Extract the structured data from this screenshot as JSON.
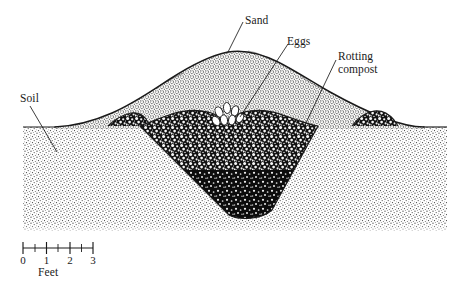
{
  "figure": {
    "labels": {
      "sand": "Sand",
      "eggs": "Eggs",
      "rotting_compost_line1": "Rotting",
      "rotting_compost_line2": "compost",
      "soil": "Soil"
    },
    "scale": {
      "unit_label": "Feet",
      "ticks": [
        "0",
        "1",
        "2",
        "3"
      ],
      "minor_ticks_between": 1
    },
    "colors": {
      "ink": "#1a1a1a",
      "paper": "#ffffff",
      "sand_fill": "#e8e5df",
      "soil_fill": "#f4f3f0",
      "compost_fill": "#1c1c1c",
      "egg_fill": "#ffffff"
    },
    "regions": [
      {
        "name": "soil",
        "texture": "fine-stipple",
        "label": "Soil"
      },
      {
        "name": "sand-mound",
        "texture": "medium-stipple",
        "label": "Sand"
      },
      {
        "name": "rotting-compost-pit",
        "texture": "coarse-mottle",
        "label": "Rotting compost"
      },
      {
        "name": "egg-cluster",
        "texture": "solid-white-ovals",
        "label": "Eggs",
        "count": 7
      }
    ]
  }
}
